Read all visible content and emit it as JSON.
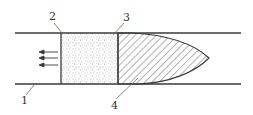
{
  "diagram": {
    "type": "pipe-section-with-plug",
    "colors": {
      "line": "#3a3a3a",
      "stipple": "#555555",
      "hatch": "#444444",
      "background": "#ffffff"
    },
    "labels": [
      {
        "id": "1",
        "text": "1",
        "target": "pipe-wall"
      },
      {
        "id": "2",
        "text": "2",
        "target": "stippled-block-left-face"
      },
      {
        "id": "3",
        "text": "3",
        "target": "block-plug-interface"
      },
      {
        "id": "4",
        "text": "4",
        "target": "hatched-plug"
      }
    ],
    "arrows": {
      "count": 3,
      "direction": "left"
    }
  }
}
